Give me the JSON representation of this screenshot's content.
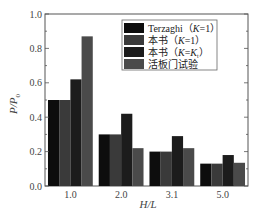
{
  "chart_data": {
    "type": "bar",
    "title": "",
    "xlabel": "H/L",
    "ylabel": "P/P0",
    "ylim": [
      0.0,
      1.0
    ],
    "yticks": [
      "0.0",
      "0.2",
      "0.4",
      "0.6",
      "0.8",
      "1.0"
    ],
    "categories": [
      "1.0",
      "2.0",
      "3.1",
      "5.0"
    ],
    "grid": false,
    "legend_position": "upper right",
    "series": [
      {
        "name": "Terzaghi（K=1）",
        "color": "#0d0d0d",
        "values": [
          0.5,
          0.3,
          0.2,
          0.13
        ]
      },
      {
        "name": "本书（K=1）",
        "color": "#3a3a3a",
        "values": [
          0.5,
          0.3,
          0.2,
          0.13
        ]
      },
      {
        "name": "本书（K=Kt）",
        "color": "#1c1c1c",
        "values": [
          0.62,
          0.42,
          0.29,
          0.18
        ]
      },
      {
        "name": "活板门试验",
        "color": "#4a4a4a",
        "values": [
          0.87,
          0.22,
          0.22,
          0.135
        ]
      }
    ]
  },
  "legend": {
    "items": [
      {
        "prefix": "Terzaghi（",
        "var": "K",
        "suffix": "=1）"
      },
      {
        "prefix": "本书（",
        "var": "K",
        "suffix": "=1）"
      },
      {
        "prefix": "本书（",
        "var": "K",
        "suffix": "=K",
        "sub": "t",
        "close": "）"
      },
      {
        "prefix": "活板门试验",
        "var": "",
        "suffix": ""
      }
    ]
  },
  "axes": {
    "xlabel_main": "H/L",
    "ylabel_main": "P/P",
    "ylabel_sub": "0"
  }
}
